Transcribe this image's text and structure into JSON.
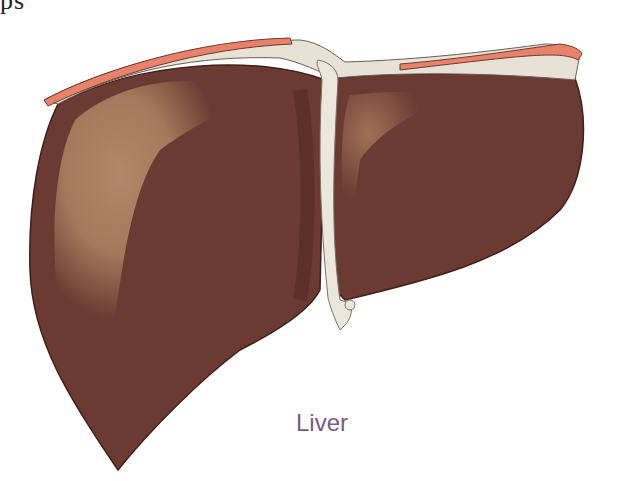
{
  "clipped_heading": "ps",
  "figure": {
    "subject": "liver",
    "label": "Liver",
    "colors": {
      "tissue": "#6b3a32",
      "tissue_dark": "#4e2620",
      "highlight": "#b88a6a",
      "ligament": "#e8e2d6",
      "peritoneum_edge": "#e9826a",
      "label_text": "#7a5a80"
    }
  }
}
